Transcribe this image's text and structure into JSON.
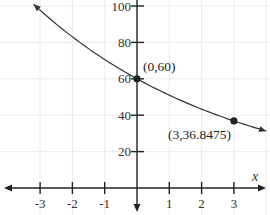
{
  "chart_data": {
    "type": "line",
    "title": "",
    "xlabel": "x",
    "ylabel": "",
    "function": "y = 60(0.85)^x",
    "xlim": [
      -3.9,
      4.1
    ],
    "ylim": [
      0,
      105
    ],
    "x_ticks": [
      -3,
      -2,
      -1,
      1,
      2,
      3
    ],
    "x_tick_labels": [
      "-3",
      "-2",
      "-1",
      "1",
      "2",
      "3"
    ],
    "y_ticks": [
      20,
      40,
      60,
      80,
      100
    ],
    "y_tick_labels": [
      "20",
      "40",
      "60",
      "80",
      "100"
    ],
    "grid": true,
    "series": [
      {
        "name": "exponential decay",
        "a": 60,
        "b": 0.85,
        "x_range": [
          -3.2,
          4.0
        ]
      }
    ],
    "points": [
      {
        "x": 0,
        "y": 60,
        "label": "(0,60)"
      },
      {
        "x": 3,
        "y": 36.8475,
        "label": "(3,36.8475)"
      }
    ]
  }
}
